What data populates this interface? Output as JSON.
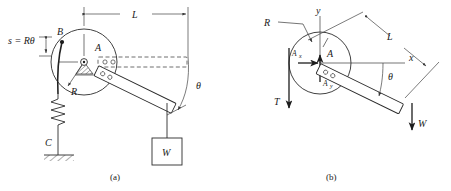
{
  "figure": {
    "panels": [
      {
        "id": "a",
        "caption": "(a)",
        "labels": {
          "arc_length": "s = Rθ",
          "point_b": "B",
          "point_a": "A",
          "radius": "R",
          "point_c": "C",
          "length": "L",
          "angle": "θ",
          "weight": "W"
        }
      },
      {
        "id": "b",
        "caption": "(b)",
        "labels": {
          "radius": "R",
          "point_a": "A",
          "axis_y": "y",
          "axis_x": "x",
          "reaction_x": "A",
          "reaction_x_sub": "x",
          "reaction_y": "A",
          "reaction_y_sub": "y",
          "tension": "T",
          "length": "L",
          "angle": "θ",
          "weight": "W"
        }
      }
    ]
  },
  "colors": {
    "line": "#2b2b2b",
    "text": "#1a1a1a",
    "background": "#ffffff",
    "dashed": "#4a4a4a"
  }
}
